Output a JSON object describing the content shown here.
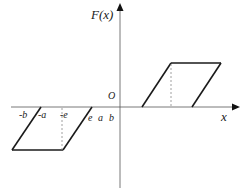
{
  "diagram": {
    "type": "hysteresis-parallelogram",
    "axes": {
      "y_label": "F(x)",
      "x_label": "x",
      "origin_label": "O"
    },
    "x_tick_labels": {
      "neg_b": "-b",
      "neg_a": "-a",
      "neg_e": "-e",
      "e": "e",
      "a": "a",
      "b": "b"
    },
    "colors": {
      "line": "#1a1a1a",
      "axis": "#555555",
      "dashed": "#888888"
    }
  }
}
